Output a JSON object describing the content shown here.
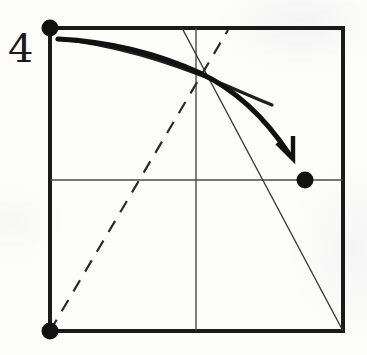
{
  "figure": {
    "title": "",
    "type": "hand-drawn geometric diagram",
    "background_color": "#fdfdfc",
    "ink_color": "#1a1a1a",
    "labels": [
      {
        "name": "y-axis-value-label",
        "text": "4",
        "x": 10,
        "y": 28,
        "font_size": 40
      }
    ],
    "square": {
      "name": "bounding-square",
      "left": 50,
      "top": 28,
      "right": 343,
      "bottom": 331,
      "stroke_width": 4,
      "color": "#1a1a1a"
    },
    "gridlines": [
      {
        "name": "midline-horizontal",
        "x1": 50,
        "y1": 180,
        "x2": 343,
        "y2": 180,
        "stroke_width": 1.4,
        "color": "#4a4a4a"
      },
      {
        "name": "midline-vertical",
        "x1": 196,
        "y1": 28,
        "x2": 196,
        "y2": 331,
        "stroke_width": 1.4,
        "color": "#4a4a4a"
      }
    ],
    "thin_diagonal": {
      "name": "thin-diagonal-line",
      "x1": 182,
      "y1": 28,
      "x2": 343,
      "y2": 331,
      "stroke_width": 1.4,
      "color": "#3a3a3a"
    },
    "dashed_line": {
      "name": "dashed-diagonal-line",
      "x1": 50,
      "y1": 331,
      "x2": 228,
      "y2": 30,
      "stroke_width": 2.2,
      "dash_pattern": "13 10",
      "color": "#2a2a2a"
    },
    "curves": [
      {
        "name": "thin-demand-curve",
        "path": "M 58 39 C 120 45, 180 66, 225 85 C 248 95, 262 101, 272 105",
        "stroke_width": 3.2,
        "color": "#1f1f1f",
        "has_arrow": false
      },
      {
        "name": "thick-shifted-curve",
        "path": "M 58 39 C 118 42, 165 57, 200 73 C 240 92, 268 122, 289 154",
        "stroke_width": 5.2,
        "color": "#111111",
        "has_arrow": true,
        "arrow_tip": {
          "x": 292,
          "y": 160
        }
      }
    ],
    "points": [
      {
        "name": "point-top-left-intercept",
        "x": 50,
        "y": 28,
        "radius": 8.5,
        "color": "#111111"
      },
      {
        "name": "point-origin",
        "x": 50,
        "y": 331,
        "radius": 8.5,
        "color": "#111111"
      },
      {
        "name": "point-right-midline",
        "x": 305,
        "y": 180,
        "radius": 8.5,
        "color": "#111111"
      }
    ],
    "arrowhead": {
      "name": "curve-direction-arrowhead",
      "points": "277,143 293,159 293,136",
      "stroke_width": 4.4,
      "color": "#111111"
    }
  }
}
